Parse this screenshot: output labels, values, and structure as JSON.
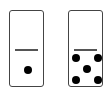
{
  "dominoes": [
    {
      "top": 0,
      "bottom": 1,
      "left": 9,
      "pips": [
        {
          "x": 14,
          "y": 55
        }
      ]
    },
    {
      "top": 0,
      "bottom": 5,
      "left": 68,
      "pips": [
        {
          "x": 3,
          "y": 43
        },
        {
          "x": 25,
          "y": 43
        },
        {
          "x": 14,
          "y": 54
        },
        {
          "x": 3,
          "y": 65
        },
        {
          "x": 25,
          "y": 65
        }
      ]
    }
  ]
}
